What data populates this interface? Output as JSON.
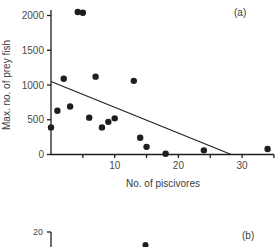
{
  "chart_data": [
    {
      "type": "scatter",
      "panel": "(a)",
      "title": "",
      "xlabel": "No. of piscivores",
      "ylabel": "Max. no. of prey fish",
      "xlim": [
        0,
        35
      ],
      "ylim": [
        0,
        2100
      ],
      "x_ticks": [
        0,
        5,
        10,
        15,
        20,
        25,
        30,
        35
      ],
      "x_tick_labels": [
        "",
        "",
        "10",
        "",
        "20",
        "",
        "30",
        ""
      ],
      "y_ticks": [
        0,
        500,
        1000,
        1500,
        2000
      ],
      "y_tick_labels": [
        "0",
        "500",
        "1000",
        "1500",
        "2000"
      ],
      "grid": false,
      "legend": null,
      "points": [
        {
          "x": 0,
          "y": 390
        },
        {
          "x": 1,
          "y": 630
        },
        {
          "x": 2,
          "y": 1090
        },
        {
          "x": 3,
          "y": 690
        },
        {
          "x": 4.2,
          "y": 2050
        },
        {
          "x": 5,
          "y": 2040
        },
        {
          "x": 6,
          "y": 530
        },
        {
          "x": 7,
          "y": 1120
        },
        {
          "x": 8,
          "y": 390
        },
        {
          "x": 9,
          "y": 470
        },
        {
          "x": 10,
          "y": 520
        },
        {
          "x": 13,
          "y": 1060
        },
        {
          "x": 14,
          "y": 240
        },
        {
          "x": 15,
          "y": 110
        },
        {
          "x": 18,
          "y": 10
        },
        {
          "x": 24,
          "y": 60
        },
        {
          "x": 34,
          "y": 80
        }
      ],
      "regression_line": {
        "x1": 0,
        "y1": 1050,
        "x2": 28.3,
        "y2": 0
      }
    },
    {
      "type": "scatter",
      "panel": "(b)",
      "partial": true,
      "y_tick_labels": [
        "20"
      ],
      "points_visible": [
        {
          "x": 15,
          "y": 18.5
        }
      ]
    }
  ],
  "labels": {
    "panel_a": "(a)",
    "panel_b": "(b)",
    "xlabel_a": "No. of piscivores",
    "ylabel_a": "Max. no. of prey fish",
    "b_top_tick": "20"
  },
  "colors": {
    "ink": "#1e1e1e",
    "text": "#3a3a3a",
    "background": "#ffffff"
  }
}
